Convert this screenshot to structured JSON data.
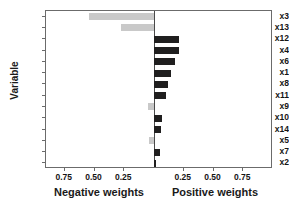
{
  "chart_data": {
    "type": "bar",
    "orientation": "horizontal",
    "title": "",
    "subtitle": "",
    "xlabel": "",
    "ylabel": "Variable",
    "xlabel_left": "Negative weights",
    "xlabel_right": "Positive weights",
    "grid": false,
    "legend": null,
    "xlim": [
      -1.0,
      1.0
    ],
    "xticks_left": [
      "0.75",
      "0.50",
      "0.25"
    ],
    "xticks_right": [
      "0.25",
      "0.50",
      "0.75"
    ],
    "xtick_values_left": [
      -0.75,
      -0.5,
      -0.25
    ],
    "xtick_values_right": [
      0.25,
      0.5,
      0.75
    ],
    "categories": [
      "x3",
      "x13",
      "x12",
      "x4",
      "x6",
      "x1",
      "x8",
      "x11",
      "x9",
      "x10",
      "x14",
      "x5",
      "x7",
      "x2"
    ],
    "values": [
      -0.55,
      -0.28,
      0.21,
      0.21,
      0.18,
      0.14,
      0.12,
      0.1,
      -0.05,
      0.07,
      0.06,
      -0.04,
      0.05,
      0.01
    ],
    "bars": [
      {
        "label": "x3",
        "value": -0.55,
        "sign": "negative",
        "color": "#c9c9c9"
      },
      {
        "label": "x13",
        "value": -0.28,
        "sign": "negative",
        "color": "#c9c9c9"
      },
      {
        "label": "x12",
        "value": 0.21,
        "sign": "positive",
        "color": "#201f1f"
      },
      {
        "label": "x4",
        "value": 0.21,
        "sign": "positive",
        "color": "#201f1f"
      },
      {
        "label": "x6",
        "value": 0.18,
        "sign": "positive",
        "color": "#201f1f"
      },
      {
        "label": "x1",
        "value": 0.14,
        "sign": "positive",
        "color": "#201f1f"
      },
      {
        "label": "x8",
        "value": 0.12,
        "sign": "positive",
        "color": "#201f1f"
      },
      {
        "label": "x11",
        "value": 0.1,
        "sign": "positive",
        "color": "#201f1f"
      },
      {
        "label": "x9",
        "value": -0.05,
        "sign": "negative",
        "color": "#c9c9c9"
      },
      {
        "label": "x10",
        "value": 0.07,
        "sign": "positive",
        "color": "#201f1f"
      },
      {
        "label": "x14",
        "value": 0.06,
        "sign": "positive",
        "color": "#201f1f"
      },
      {
        "label": "x5",
        "value": -0.04,
        "sign": "negative",
        "color": "#c9c9c9"
      },
      {
        "label": "x7",
        "value": 0.05,
        "sign": "positive",
        "color": "#201f1f"
      },
      {
        "label": "x2",
        "value": 0.01,
        "sign": "positive",
        "color": "#201f1f"
      }
    ],
    "colors": {
      "positive_bar": "#201f1f",
      "negative_bar": "#c9c9c9",
      "axis": "#6b6b6b",
      "text": "#141414",
      "background": "#ffffff"
    }
  }
}
